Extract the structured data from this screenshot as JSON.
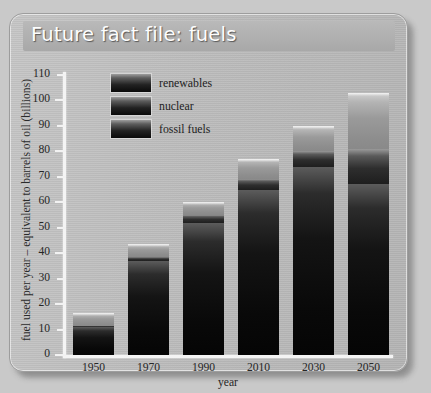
{
  "panel": {
    "title": "Future fact file: fuels"
  },
  "legend": {
    "items": [
      {
        "label": "renewables",
        "key": "renewables"
      },
      {
        "label": "nuclear",
        "key": "nuclear"
      },
      {
        "label": "fossil fuels",
        "key": "fossil"
      }
    ]
  },
  "axes": {
    "ylabel": "fuel used per year – equivalent to barrels of oil (billions)",
    "xlabel": "year",
    "yticks": [
      "0",
      "10",
      "20",
      "30",
      "40",
      "50",
      "60",
      "70",
      "80",
      "90",
      "100",
      "110"
    ],
    "xticks": [
      "1950",
      "1970",
      "1990",
      "2010",
      "2030",
      "2050"
    ]
  },
  "chart_data": {
    "type": "bar",
    "stacked": true,
    "title": "Future fact file: fuels",
    "xlabel": "year",
    "ylabel": "fuel used per year – equivalent to barrels of oil (billions)",
    "categories": [
      "1950",
      "1970",
      "1990",
      "2010",
      "2030",
      "2050"
    ],
    "ylim": [
      0,
      110
    ],
    "ytick_step": 10,
    "grid": false,
    "legend_position": "inside-top-left",
    "units": "billions of barrels of oil equivalent per year",
    "series": [
      {
        "name": "fossil fuels",
        "values": [
          11,
          37,
          52,
          65,
          74,
          67
        ]
      },
      {
        "name": "nuclear",
        "values": [
          0.5,
          1.5,
          3,
          4,
          6,
          14
        ]
      },
      {
        "name": "renewables",
        "values": [
          5,
          5,
          5,
          8,
          10,
          22
        ]
      }
    ],
    "totals": [
      16.5,
      43.5,
      60,
      77,
      90,
      103
    ],
    "annotations": []
  },
  "geometry": {
    "bar_left": [
      63,
      118,
      173,
      228,
      283,
      338
    ],
    "bar_width": 41,
    "y_zero_px": 341,
    "px_per_unit": 2.5454
  }
}
